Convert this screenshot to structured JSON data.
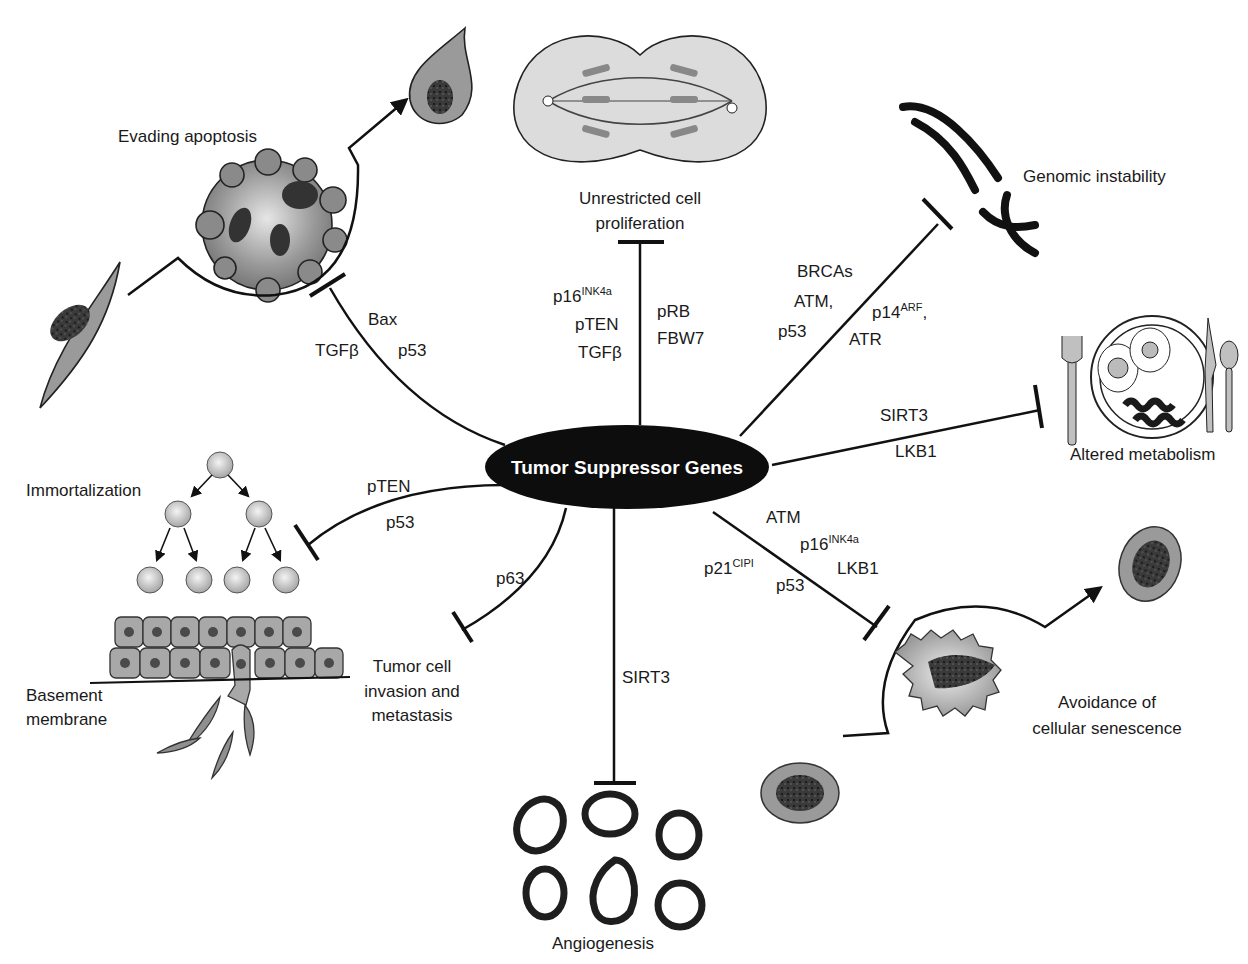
{
  "center": {
    "label": "Tumor Suppressor Genes",
    "fill": "#0d0d0d"
  },
  "hallmarks": {
    "evading_apoptosis": {
      "label": "Evading apoptosis",
      "genes": [
        "Bax",
        "TGFβ",
        "p53"
      ]
    },
    "proliferation": {
      "label_line1": "Unrestricted cell",
      "label_line2": "proliferation",
      "genes_left": [
        {
          "base": "p16",
          "sup": "INK4a"
        },
        {
          "base": "pTEN"
        },
        {
          "base": "TGFβ"
        }
      ],
      "genes_right": [
        "pRB",
        "FBW7"
      ]
    },
    "genomic_instability": {
      "label": "Genomic instability",
      "genes_left": [
        "BRCAs",
        "ATM,",
        "p53"
      ],
      "genes_right": [
        {
          "base": "p14",
          "sup": "ARF",
          "suffix": ","
        },
        {
          "base": "ATR"
        }
      ]
    },
    "altered_metabolism": {
      "label": "Altered metabolism",
      "genes": [
        "SIRT3",
        "LKB1"
      ]
    },
    "immortalization": {
      "label": "Immortalization",
      "genes": [
        "pTEN",
        "p53"
      ]
    },
    "invasion": {
      "label_line1": "Tumor cell",
      "label_line2": "invasion and",
      "label_line3": "metastasis",
      "genes": [
        "p63"
      ],
      "basement_line1": "Basement",
      "basement_line2": "membrane"
    },
    "angiogenesis": {
      "label": "Angiogenesis",
      "genes": [
        "SIRT3"
      ]
    },
    "senescence": {
      "label_line1": "Avoidance of",
      "label_line2": "cellular senescence",
      "genes": [
        "ATM",
        {
          "base": "p16",
          "sup": "INK4a"
        },
        "LKB1",
        {
          "base": "p21",
          "sup": "CIPI"
        },
        "p53"
      ]
    }
  },
  "colors": {
    "cell_fill": "#8c8c8c",
    "cell_light": "#c8c8c8",
    "stroke": "#111111",
    "background": "#ffffff"
  }
}
